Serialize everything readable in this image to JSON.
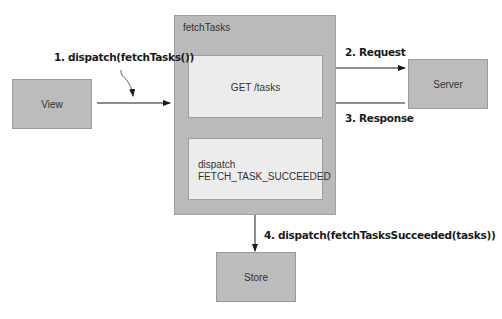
{
  "nodes": {
    "view": "View",
    "server": "Server",
    "store": "Store",
    "fetch_tasks": {
      "title": "fetchTasks",
      "get_box": "GET /tasks",
      "dispatch_box": {
        "line1": "dispatch",
        "line2": "FETCH_TASK_SUCCEEDED"
      }
    }
  },
  "edges": {
    "step1": "1. dispatch(fetchTasks())",
    "step2": "2. Request",
    "step3": "3. Response",
    "step4": "4. dispatch(fetchTasksSucceeded(tasks))"
  },
  "colors": {
    "node_fill": "#bcbcbc",
    "container_fill": "#bababa",
    "inner_fill": "#ececec",
    "arrow": "#1a1a1a"
  }
}
